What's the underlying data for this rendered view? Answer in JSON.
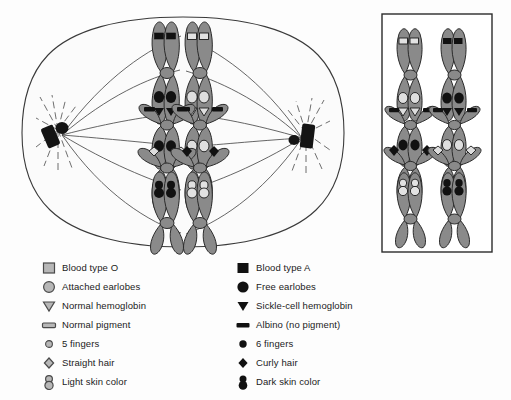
{
  "figure": {
    "type": "cell-division-diagram",
    "stage": "metaphase"
  },
  "colors": {
    "chromosome_fill": "#8a8a8a",
    "chromosome_stroke": "#2b2b2b",
    "allele_dominant": "#111111",
    "allele_recessive": "#d8d8d8",
    "cell_fill": "#fbfbfb",
    "cell_stroke": "#3a3a3a",
    "spindle": "#4a4a4a",
    "centrosome": "#141414",
    "inset_border": "#2b2b2b",
    "text": "#1b1b1b",
    "background": "#fdfdfd"
  },
  "cell": {
    "name": "dividing-cell",
    "centrosome_left_label": "centrosome-left",
    "centrosome_right_label": "centrosome-right",
    "spindle_fiber_count": 10,
    "aster_ray_count": 9
  },
  "inset": {
    "name": "alternate-arrangement-inset",
    "x": 382,
    "y": 14,
    "width": 110,
    "height": 238
  },
  "chromosome_groups": [
    {
      "id": "group-1",
      "trait": "blood-type",
      "marker": "square",
      "left_allele": "dominant",
      "right_allele": "recessive"
    },
    {
      "id": "group-2",
      "trait": "earlobes-and-hemoglobin",
      "marker": "circle-and-triangle",
      "left_allele": "dominant",
      "right_allele": "recessive"
    },
    {
      "id": "group-3",
      "trait": "pigment-fingers-hair",
      "marker": "rect-circle-diamond",
      "left_allele": "dominant",
      "right_allele": "recessive"
    },
    {
      "id": "group-4",
      "trait": "skin-color",
      "marker": "figure-eight",
      "left_allele": "dominant",
      "right_allele": "recessive"
    }
  ],
  "legend": {
    "left_column": [
      {
        "symbol": "square",
        "shade": "light",
        "label": "Blood type O"
      },
      {
        "symbol": "circle",
        "shade": "light",
        "label": "Attached earlobes"
      },
      {
        "symbol": "triangle-down",
        "shade": "light",
        "label": "Normal hemoglobin"
      },
      {
        "symbol": "rect",
        "shade": "light",
        "label": "Normal pigment"
      },
      {
        "symbol": "small-circle",
        "shade": "light",
        "label": "5 fingers"
      },
      {
        "symbol": "diamond",
        "shade": "light",
        "label": "Straight hair"
      },
      {
        "symbol": "figure-eight",
        "shade": "light",
        "label": "Light skin color"
      }
    ],
    "right_column": [
      {
        "symbol": "square",
        "shade": "dark",
        "label": "Blood type A"
      },
      {
        "symbol": "circle",
        "shade": "dark",
        "label": "Free earlobes"
      },
      {
        "symbol": "triangle-down",
        "shade": "dark",
        "label": "Sickle-cell hemoglobin"
      },
      {
        "symbol": "rect",
        "shade": "dark",
        "label": "Albino (no pigment)"
      },
      {
        "symbol": "small-circle",
        "shade": "dark",
        "label": "6 fingers"
      },
      {
        "symbol": "diamond",
        "shade": "dark",
        "label": "Curly hair"
      },
      {
        "symbol": "figure-eight",
        "shade": "dark",
        "label": "Dark skin color"
      }
    ]
  }
}
